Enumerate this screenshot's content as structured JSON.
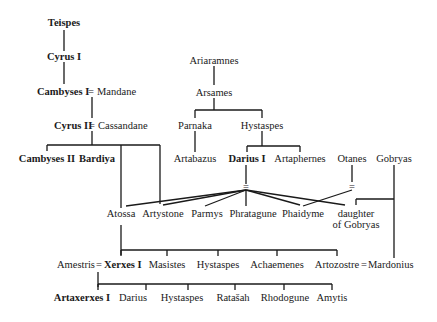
{
  "people": {
    "teispes": {
      "label": "Teispes",
      "bold": true
    },
    "cyrus1": {
      "label": "Cyrus I",
      "bold": true
    },
    "cambyses1": {
      "label": "Cambyses I",
      "bold": true
    },
    "mandane": {
      "label": "Mandane",
      "bold": false
    },
    "cyrus2": {
      "label": "Cyrus II",
      "bold": true
    },
    "cassandane": {
      "label": "Cassandane",
      "bold": false
    },
    "cambyses2": {
      "label": "Cambyses II",
      "bold": true
    },
    "bardiya": {
      "label": "Bardiya",
      "bold": true
    },
    "ariaramnes": {
      "label": "Ariaramnes",
      "bold": false
    },
    "arsames": {
      "label": "Arsames",
      "bold": false
    },
    "parnaka": {
      "label": "Parnaka",
      "bold": false
    },
    "hystaspes1": {
      "label": "Hystaspes",
      "bold": false
    },
    "artabazus": {
      "label": "Artabazus",
      "bold": false
    },
    "darius1": {
      "label": "Darius I",
      "bold": true
    },
    "artaphernes": {
      "label": "Artaphernes",
      "bold": false
    },
    "otanes": {
      "label": "Otanes",
      "bold": false
    },
    "gobryas": {
      "label": "Gobryas",
      "bold": false
    },
    "atossa": {
      "label": "Atossa",
      "bold": false
    },
    "artystone": {
      "label": "Artystone",
      "bold": false
    },
    "parmys": {
      "label": "Parmys",
      "bold": false
    },
    "phratagune": {
      "label": "Phratagune",
      "bold": false
    },
    "phaidyme": {
      "label": "Phaidyme",
      "bold": false
    },
    "daughter_gobryas_1": {
      "label": "daughter",
      "bold": false
    },
    "daughter_gobryas_2": {
      "label": "of Gobryas",
      "bold": false
    },
    "amestris": {
      "label": "Amestris",
      "bold": false
    },
    "xerxes1": {
      "label": "Xerxes I",
      "bold": true
    },
    "masistes": {
      "label": "Masistes",
      "bold": false
    },
    "hystaspes2": {
      "label": "Hystaspes",
      "bold": false
    },
    "achaemenes": {
      "label": "Achaemenes",
      "bold": false
    },
    "artozostre": {
      "label": "Artozostre",
      "bold": false
    },
    "mardonius": {
      "label": "Mardonius",
      "bold": false
    },
    "artaxerxes1": {
      "label": "Artaxerxes I",
      "bold": true
    },
    "darius_son": {
      "label": "Darius",
      "bold": false
    },
    "hystaspes3": {
      "label": "Hystaspes",
      "bold": false
    },
    "ratasah": {
      "label": "Ratašah",
      "bold": false
    },
    "rhodogune": {
      "label": "Rhodogune",
      "bold": false
    },
    "amytis": {
      "label": "Amytis",
      "bold": false
    }
  },
  "marriage_symbol": "="
}
